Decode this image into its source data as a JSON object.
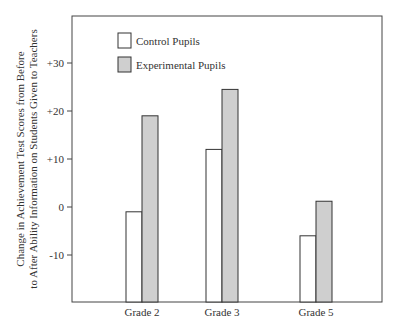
{
  "chart_data": {
    "type": "bar",
    "title": "",
    "xlabel": "",
    "ylabel_lines": [
      "Change in Achievement Test Scores from Before",
      "to After Ability Information on Students Given to Teachers"
    ],
    "categories": [
      "Grade 2",
      "Grade 3",
      "Grade 5"
    ],
    "series": [
      {
        "name": "Control Pupils",
        "values": [
          -1,
          12,
          -6
        ],
        "color": "#ffffff"
      },
      {
        "name": "Experimental Pupils",
        "values": [
          19,
          24.5,
          1.2
        ],
        "color": "#cfcfcf"
      }
    ],
    "ylim": [
      -20,
      38
    ],
    "yticks": [
      30,
      20,
      10,
      0,
      -10
    ],
    "ytick_labels": [
      "+30",
      "+20",
      "+10",
      "0",
      "-10"
    ],
    "grid": false,
    "legend_position": "top-left",
    "legend": [
      "Control Pupils",
      "Experimental Pupils"
    ]
  }
}
